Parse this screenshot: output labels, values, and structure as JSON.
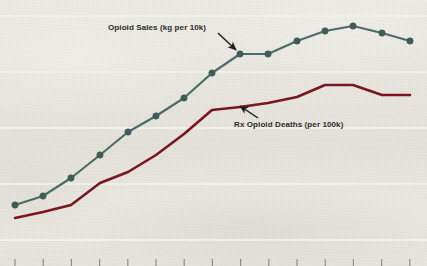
{
  "figure": {
    "name": "opioid-sales-and-deaths-chart",
    "background_color": "#e9e7e0",
    "gridline_color": "#f2f0ea",
    "tick_color": "#8f8d86"
  },
  "annotations": {
    "opioid_sales_label": "Opioid Sales (kg per 10k)",
    "rx_deaths_label": "Rx Opioid Deaths (per 100k)"
  },
  "chart_data": {
    "type": "line",
    "title": "",
    "subtitle": "",
    "xlabel": "",
    "ylabel": "",
    "grid": true,
    "grid_orientation": "horizontal",
    "legend_position": "inline-annotations",
    "x_axis": {
      "tick_count": 15,
      "tick_labels": [],
      "labels_visible": false,
      "axis_line_visible": false,
      "tick_pixel_spacing": 28.2
    },
    "y_axis": {
      "tick_labels": [],
      "labels_visible": false,
      "gridline_count": 5
    },
    "x": [
      1,
      2,
      3,
      4,
      5,
      6,
      7,
      8,
      9,
      10,
      11,
      12,
      13,
      14,
      15
    ],
    "series": [
      {
        "name": "Opioid Sales (kg per 10k)",
        "color": "#4d6b68",
        "marker": "circle",
        "marker_color": "#3f5c59",
        "marker_radius": 3.2,
        "line_width": 2.2,
        "values": [
          1.0,
          1.6,
          2.6,
          3.6,
          4.7,
          5.5,
          6.4,
          7.5,
          8.3,
          8.4,
          9.1,
          9.6,
          10.0,
          9.6,
          9.1
        ],
        "pixel_points": [
          [
            15,
            205
          ],
          [
            43,
            196
          ],
          [
            71,
            178
          ],
          [
            100,
            155
          ],
          [
            128,
            132
          ],
          [
            156,
            116
          ],
          [
            184,
            98
          ],
          [
            212,
            73
          ],
          [
            240,
            54
          ],
          [
            268,
            54
          ],
          [
            297,
            41
          ],
          [
            325,
            31
          ],
          [
            353,
            26
          ],
          [
            382,
            33
          ],
          [
            410,
            41
          ]
        ]
      },
      {
        "name": "Rx Opioid Deaths (per 100k)",
        "color": "#7a1620",
        "marker": "none",
        "line_width": 2.6,
        "values": [
          0.5,
          0.9,
          1.3,
          2.3,
          2.7,
          3.4,
          4.4,
          5.9,
          6.1,
          6.4,
          6.8,
          7.4,
          7.4,
          6.9,
          6.9
        ],
        "pixel_points": [
          [
            15,
            218
          ],
          [
            43,
            212
          ],
          [
            71,
            205
          ],
          [
            100,
            183
          ],
          [
            128,
            172
          ],
          [
            156,
            155
          ],
          [
            184,
            134
          ],
          [
            212,
            110
          ],
          [
            240,
            107
          ],
          [
            268,
            103
          ],
          [
            297,
            97
          ],
          [
            325,
            85
          ],
          [
            353,
            85
          ],
          [
            382,
            95
          ],
          [
            410,
            95
          ]
        ]
      }
    ],
    "annotations": [
      {
        "text": "Opioid Sales (kg per 10k)",
        "target_series": "Opioid Sales (kg per 10k)",
        "arrow_from": [
          218,
          33
        ],
        "arrow_to": [
          236,
          50
        ]
      },
      {
        "text": "Rx Opioid Deaths (per 100k)",
        "target_series": "Rx Opioid Deaths (per 100k)",
        "arrow_from": [
          258,
          118
        ],
        "arrow_to": [
          240,
          106
        ]
      }
    ]
  }
}
